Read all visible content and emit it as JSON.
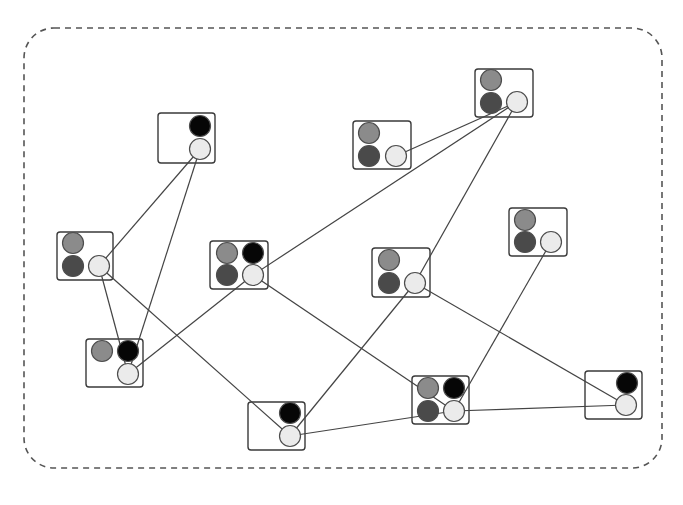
{
  "diagram": {
    "type": "network-graph",
    "container": {
      "x": 24,
      "y": 28,
      "width": 638,
      "height": 440,
      "radius": 30,
      "stroke": "#555555",
      "dash": "6,5"
    },
    "colors": {
      "gray": "#8b8b8b",
      "dark": "#4a4a4a",
      "black": "#060606",
      "light": "#ebebeb",
      "outline": "#4d4d4d",
      "edge": "#444444",
      "box": "#3a3a3a"
    },
    "circle_radius": 10.5,
    "nodes": [
      {
        "id": "A",
        "box": [
          158,
          113,
          57,
          50
        ],
        "circles": [
          {
            "color": "black",
            "cx": 200,
            "cy": 126
          },
          {
            "color": "light",
            "cx": 200,
            "cy": 149
          }
        ]
      },
      {
        "id": "B",
        "box": [
          57,
          232,
          56,
          48
        ],
        "circles": [
          {
            "color": "gray",
            "cx": 73,
            "cy": 243
          },
          {
            "color": "dark",
            "cx": 73,
            "cy": 266
          },
          {
            "color": "light",
            "cx": 99,
            "cy": 266
          }
        ]
      },
      {
        "id": "C",
        "box": [
          86,
          339,
          57,
          48
        ],
        "circles": [
          {
            "color": "gray",
            "cx": 102,
            "cy": 351
          },
          {
            "color": "black",
            "cx": 128,
            "cy": 351
          },
          {
            "color": "light",
            "cx": 128,
            "cy": 374
          }
        ]
      },
      {
        "id": "D",
        "box": [
          210,
          241,
          58,
          48
        ],
        "circles": [
          {
            "color": "gray",
            "cx": 227,
            "cy": 253
          },
          {
            "color": "black",
            "cx": 253,
            "cy": 253
          },
          {
            "color": "dark",
            "cx": 227,
            "cy": 275
          },
          {
            "color": "light",
            "cx": 253,
            "cy": 275
          }
        ]
      },
      {
        "id": "E",
        "box": [
          248,
          402,
          57,
          48
        ],
        "circles": [
          {
            "color": "black",
            "cx": 290,
            "cy": 413
          },
          {
            "color": "light",
            "cx": 290,
            "cy": 436
          }
        ]
      },
      {
        "id": "F",
        "box": [
          353,
          121,
          58,
          48
        ],
        "circles": [
          {
            "color": "gray",
            "cx": 369,
            "cy": 133
          },
          {
            "color": "dark",
            "cx": 369,
            "cy": 156
          },
          {
            "color": "light",
            "cx": 396,
            "cy": 156
          }
        ]
      },
      {
        "id": "G",
        "box": [
          475,
          69,
          58,
          48
        ],
        "circles": [
          {
            "color": "gray",
            "cx": 491,
            "cy": 80
          },
          {
            "color": "dark",
            "cx": 491,
            "cy": 103
          },
          {
            "color": "light",
            "cx": 517,
            "cy": 102
          }
        ]
      },
      {
        "id": "H",
        "box": [
          372,
          248,
          58,
          49
        ],
        "circles": [
          {
            "color": "gray",
            "cx": 389,
            "cy": 260
          },
          {
            "color": "dark",
            "cx": 389,
            "cy": 283
          },
          {
            "color": "light",
            "cx": 415,
            "cy": 283
          }
        ]
      },
      {
        "id": "I",
        "box": [
          509,
          208,
          58,
          48
        ],
        "circles": [
          {
            "color": "gray",
            "cx": 525,
            "cy": 220
          },
          {
            "color": "dark",
            "cx": 525,
            "cy": 242
          },
          {
            "color": "light",
            "cx": 551,
            "cy": 242
          }
        ]
      },
      {
        "id": "J",
        "box": [
          412,
          376,
          57,
          48
        ],
        "circles": [
          {
            "color": "gray",
            "cx": 428,
            "cy": 388
          },
          {
            "color": "black",
            "cx": 454,
            "cy": 388
          },
          {
            "color": "dark",
            "cx": 428,
            "cy": 411
          },
          {
            "color": "light",
            "cx": 454,
            "cy": 411
          }
        ]
      },
      {
        "id": "K",
        "box": [
          585,
          371,
          57,
          48
        ],
        "circles": [
          {
            "color": "black",
            "cx": 627,
            "cy": 383
          },
          {
            "color": "light",
            "cx": 626,
            "cy": 405
          }
        ]
      }
    ],
    "edges": [
      [
        "A",
        "B"
      ],
      [
        "A",
        "C"
      ],
      [
        "B",
        "C"
      ],
      [
        "B",
        "E"
      ],
      [
        "C",
        "D"
      ],
      [
        "D",
        "G"
      ],
      [
        "D",
        "J"
      ],
      [
        "F",
        "G"
      ],
      [
        "G",
        "H"
      ],
      [
        "H",
        "E"
      ],
      [
        "H",
        "K"
      ],
      [
        "I",
        "J"
      ],
      [
        "J",
        "K"
      ],
      [
        "E",
        "J"
      ]
    ]
  }
}
